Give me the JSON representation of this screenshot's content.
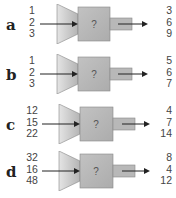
{
  "machines": [
    {
      "label": "a",
      "inputs": [
        "1",
        "2",
        "3"
      ],
      "outputs": [
        "3",
        "6",
        "9"
      ],
      "symbol": "?"
    },
    {
      "label": "b",
      "inputs": [
        "1",
        "2",
        "3"
      ],
      "outputs": [
        "5",
        "6",
        "7"
      ],
      "symbol": "?"
    },
    {
      "label": "c",
      "inputs": [
        "12",
        "15",
        "22"
      ],
      "outputs": [
        "4",
        "7",
        "14"
      ],
      "symbol": "?"
    },
    {
      "label": "d",
      "inputs": [
        "32",
        "16",
        "48"
      ],
      "outputs": [
        "8",
        "4",
        "12"
      ],
      "symbol": "?"
    }
  ],
  "colors": {
    "machine_body": "#b4b4b4",
    "machine_funnel_light": "#e6e6e6",
    "arrow": "#222222"
  }
}
